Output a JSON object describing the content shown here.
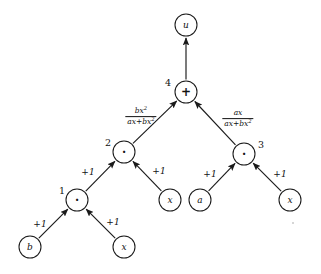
{
  "figure": {
    "background_color": "#ffffff",
    "ink_color": "#1a1a1a",
    "width": 321,
    "height": 274
  },
  "nodes": [
    {
      "id": "u",
      "label": "u",
      "kind": "variable",
      "index": "",
      "cx": 186,
      "cy": 25,
      "r": 11
    },
    {
      "id": "n4",
      "label": "+",
      "kind": "operator",
      "index": "4",
      "cx": 186,
      "cy": 92,
      "r": 11,
      "index_x": 168,
      "index_y": 82
    },
    {
      "id": "n2",
      "label": "·",
      "kind": "operator",
      "index": "2",
      "cx": 124,
      "cy": 152,
      "r": 11,
      "index_x": 108,
      "index_y": 142
    },
    {
      "id": "n3",
      "label": "·",
      "kind": "operator",
      "index": "3",
      "cx": 244,
      "cy": 154,
      "r": 11,
      "index_x": 261,
      "index_y": 144
    },
    {
      "id": "n1",
      "label": "·",
      "kind": "operator",
      "index": "1",
      "cx": 77,
      "cy": 200,
      "r": 11,
      "index_x": 62,
      "index_y": 190
    },
    {
      "id": "x2",
      "label": "x",
      "kind": "variable",
      "index": "",
      "cx": 170,
      "cy": 200,
      "r": 11
    },
    {
      "id": "a",
      "label": "a",
      "kind": "variable",
      "index": "",
      "cx": 200,
      "cy": 200,
      "r": 11
    },
    {
      "id": "x3",
      "label": "x",
      "kind": "variable",
      "index": "",
      "cx": 290,
      "cy": 200,
      "r": 11
    },
    {
      "id": "b",
      "label": "b",
      "kind": "variable",
      "index": "",
      "cx": 30,
      "cy": 247,
      "r": 11
    },
    {
      "id": "x1",
      "label": "x",
      "kind": "variable",
      "index": "",
      "cx": 124,
      "cy": 247,
      "r": 11
    }
  ],
  "edges": [
    {
      "id": "e-n4-u",
      "from": "n4",
      "to": "u",
      "label_type": "none"
    },
    {
      "id": "e-n2-n4",
      "from": "n2",
      "to": "n4",
      "label_type": "fraction",
      "numerator": "bx",
      "numerator_sup": "2",
      "denominator": "ax+bx",
      "denominator_sup": "2",
      "label_x": 141,
      "label_y": 117
    },
    {
      "id": "e-n3-n4",
      "from": "n3",
      "to": "n4",
      "label_type": "fraction",
      "numerator": "ax",
      "numerator_sup": "",
      "denominator": "ax+bx",
      "denominator_sup": "2",
      "label_x": 238,
      "label_y": 119
    },
    {
      "id": "e-n1-n2",
      "from": "n1",
      "to": "n2",
      "label_type": "text",
      "label": "+1",
      "label_x": 88,
      "label_y": 172
    },
    {
      "id": "e-x2-n2",
      "from": "x2",
      "to": "n2",
      "label_type": "text",
      "label": "+1",
      "label_x": 159,
      "label_y": 171
    },
    {
      "id": "e-a-n3",
      "from": "a",
      "to": "n3",
      "label_type": "text",
      "label": "+1",
      "label_x": 210,
      "label_y": 174
    },
    {
      "id": "e-x3-n3",
      "from": "x3",
      "to": "n3",
      "label_type": "text",
      "label": "+1",
      "label_x": 280,
      "label_y": 174
    },
    {
      "id": "e-b-n1",
      "from": "b",
      "to": "n1",
      "label_type": "text",
      "label": "+1",
      "label_x": 40,
      "label_y": 224
    },
    {
      "id": "e-x1-n1",
      "from": "x1",
      "to": "n1",
      "label_type": "text",
      "label": "+1",
      "label_x": 113,
      "label_y": 222
    }
  ],
  "legend": {
    "operator_multiply_symbol": "·",
    "operator_add_symbol": "+"
  }
}
